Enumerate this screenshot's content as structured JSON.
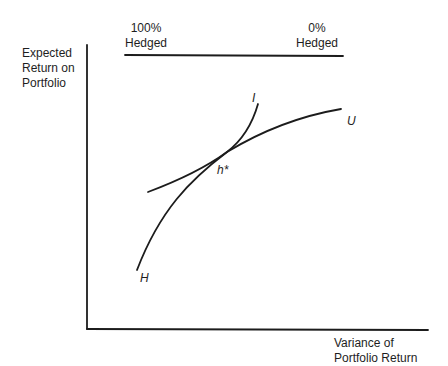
{
  "diagram": {
    "y_axis_label": [
      "Expected",
      "Return on",
      "Portfolio"
    ],
    "x_axis_label": [
      "Variance of",
      "Portfolio Return"
    ],
    "hedge_scale": {
      "left_label": [
        "100%",
        "Hedged"
      ],
      "right_label": [
        "0%",
        "Hedged"
      ]
    },
    "curves": {
      "indifference": {
        "label": "I"
      },
      "opportunity_upper": {
        "label": "U"
      },
      "opportunity_lower": {
        "label": "H"
      }
    },
    "tangency_point": {
      "label": "h*"
    }
  },
  "colors": {
    "ink": "#1c1c1c",
    "background": "#ffffff"
  }
}
